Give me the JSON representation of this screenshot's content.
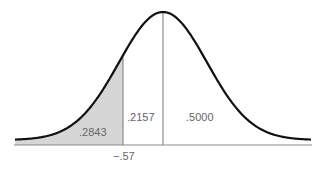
{
  "chart_data": {
    "type": "area",
    "title": "",
    "xlabel": "",
    "ylabel": "",
    "x_marker": {
      "label": "−.57",
      "z": -0.57
    },
    "mean_marker": {
      "z": 0
    },
    "regions": [
      {
        "name": "left-tail",
        "label": ".2843",
        "from": "-inf",
        "to": -0.57,
        "shaded": true,
        "area": 0.2843
      },
      {
        "name": "between",
        "label": ".2157",
        "from": -0.57,
        "to": 0,
        "shaded": false,
        "area": 0.2157
      },
      {
        "name": "right-half",
        "label": ".5000",
        "from": 0,
        "to": "inf",
        "shaded": false,
        "area": 0.5
      }
    ],
    "grid": false,
    "legend": null
  },
  "labels": {
    "left_tail": ".2843",
    "between": ".2157",
    "right_half": ".5000",
    "z_value": "−.57"
  },
  "colors": {
    "curve": "#111111",
    "shade": "#d6d6d6",
    "lines": "#8a8a8a",
    "text": "#666666",
    "background": "#ffffff"
  }
}
